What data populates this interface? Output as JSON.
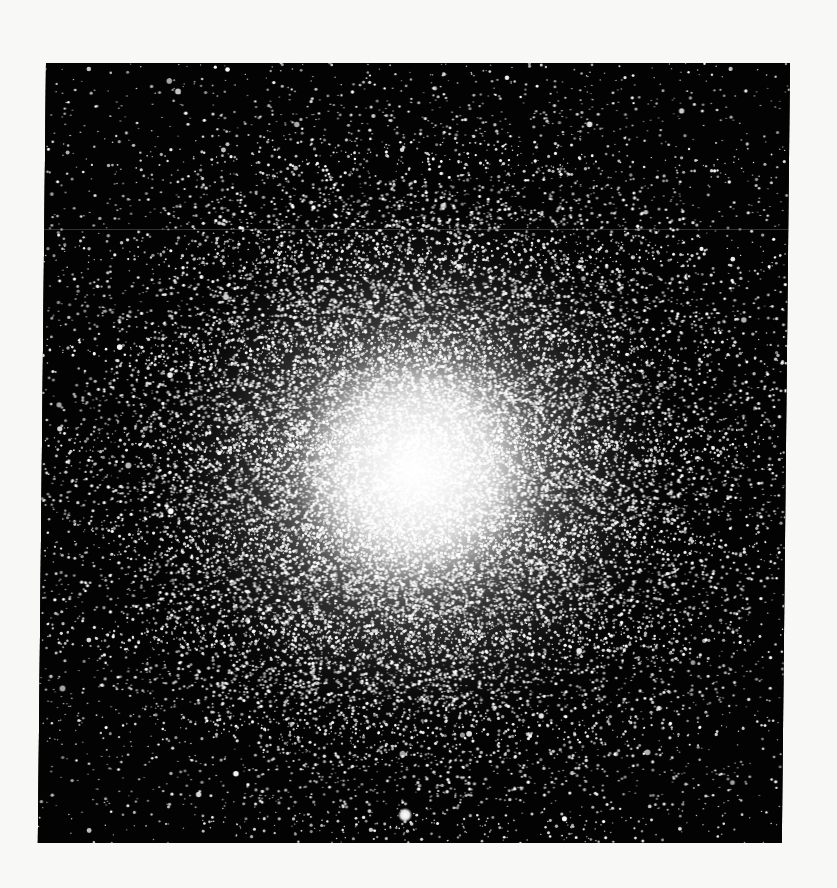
{
  "image": {
    "subject": "globular-cluster-photograph",
    "page_background": "#f8f8f6",
    "plate": {
      "background": "#030303",
      "x": 46,
      "y": 63,
      "width": 744,
      "height": 780,
      "skew_deg": -0.6
    },
    "core": {
      "center_x": 374,
      "center_y": 407,
      "core_radius": 120,
      "halo_radius": 300,
      "color": "#ffffff"
    },
    "field_stars": {
      "count": 2600,
      "cluster_stars": 26000,
      "seed": 7
    },
    "bright_star": {
      "x": 367,
      "y": 752,
      "radius": 4.5
    },
    "scan_line_y": 166
  }
}
